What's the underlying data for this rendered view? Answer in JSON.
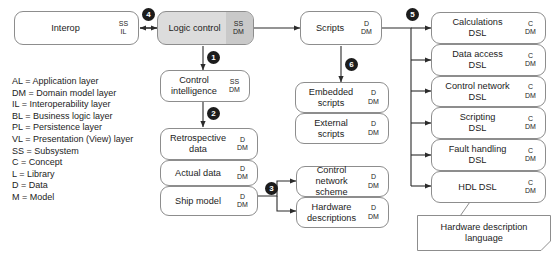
{
  "diagram": {
    "legend": {
      "name": "abbreviation-legend",
      "lines": [
        "AL = Application layer",
        "DM = Domain model layer",
        "IL = Interoperability layer",
        "BL = Business logic layer",
        "PL = Persistence layer",
        "VL = Presentation (View) layer",
        "SS = Subsystem",
        "C = Concept",
        "L = Library",
        "D = Data",
        "M = Model"
      ]
    },
    "nodes": {
      "interop": {
        "title": "Interop",
        "tag": "SS\nIL"
      },
      "logic_control": {
        "title": "Logic control",
        "tag": "SS\nDM"
      },
      "control_intelligence": {
        "title": "Control\nintelligence",
        "tag": "SS\nDM"
      },
      "retrospective_data": {
        "title": "Retrospective\ndata",
        "tag": "D\nDM"
      },
      "actual_data": {
        "title": "Actual data",
        "tag": "D\nDM"
      },
      "ship_model": {
        "title": "Ship model",
        "tag": "D\nDM"
      },
      "scripts": {
        "title": "Scripts",
        "tag": "D\nDM"
      },
      "embedded_scripts": {
        "title": "Embedded\nscripts",
        "tag": "D\nDM"
      },
      "external_scripts": {
        "title": "External\nscripts",
        "tag": "D\nDM"
      },
      "control_network_scheme": {
        "title": "Control network\nscheme",
        "tag": "D\nDM"
      },
      "hardware_descriptions": {
        "title": "Hardware\ndescriptions",
        "tag": "D\nDM"
      },
      "calculations_dsl": {
        "title": "Calculations\nDSL",
        "tag": "C\nDM"
      },
      "data_access_dsl": {
        "title": "Data access\nDSL",
        "tag": "C\nDM"
      },
      "control_network_dsl": {
        "title": "Control network\nDSL",
        "tag": "C\nDM"
      },
      "scripting_dsl": {
        "title": "Scripting\nDSL",
        "tag": "C\nDM"
      },
      "fault_handling_dsl": {
        "title": "Fault handling\nDSL",
        "tag": "C\nDM"
      },
      "hdl_dsl": {
        "title": "HDL DSL",
        "tag": "C\nDM"
      }
    },
    "note": {
      "hdl_note": "Hardware description\nlanguage"
    },
    "badges": [
      {
        "id": "badge-1",
        "label": "1"
      },
      {
        "id": "badge-2",
        "label": "2"
      },
      {
        "id": "badge-3",
        "label": "3"
      },
      {
        "id": "badge-4",
        "label": "4"
      },
      {
        "id": "badge-5",
        "label": "5"
      },
      {
        "id": "badge-6",
        "label": "6"
      }
    ],
    "colors": {
      "stroke": "#8d8d8d",
      "arrow": "#2b2b2b",
      "shaded_fill": "#dcdcdc",
      "shaded_tag_fill": "#c9c9c9",
      "badge_fill": "#1c1c1c",
      "text": "#1c1c1c"
    }
  }
}
